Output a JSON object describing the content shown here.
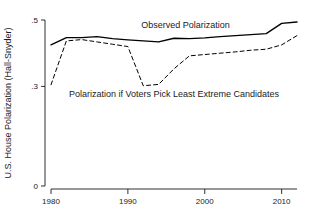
{
  "chart_data": {
    "type": "line",
    "title": "",
    "xlabel": "",
    "ylabel": "U.S. House Polarization (Hall-Snyder)",
    "xlim": [
      1980,
      2012
    ],
    "ylim": [
      0,
      0.5
    ],
    "xticks": [
      1980,
      1990,
      2000,
      2010
    ],
    "xtick_labels": [
      "1980",
      "1990",
      "2000",
      "2010"
    ],
    "yticks": [
      0,
      0.3,
      0.5
    ],
    "ytick_labels": [
      "0",
      ".3",
      ".5"
    ],
    "grid": false,
    "legend": "inline-annotations",
    "x": [
      1980,
      1982,
      1984,
      1986,
      1988,
      1990,
      1992,
      1994,
      1996,
      1998,
      2000,
      2002,
      2004,
      2006,
      2008,
      2010,
      2012
    ],
    "series": [
      {
        "name": "Observed Polarization",
        "style": "solid",
        "color": "#000000",
        "values": [
          0.425,
          0.447,
          0.447,
          0.45,
          0.444,
          0.44,
          0.437,
          0.434,
          0.445,
          0.444,
          0.446,
          0.45,
          0.453,
          0.456,
          0.459,
          0.49,
          0.494
        ]
      },
      {
        "name": "Polarization if Voters Pick Least Extreme Candidates",
        "style": "dashed",
        "color": "#000000",
        "values": [
          0.305,
          0.437,
          0.441,
          0.434,
          0.427,
          0.42,
          0.302,
          0.306,
          0.353,
          0.392,
          0.396,
          0.4,
          0.404,
          0.409,
          0.412,
          0.425,
          0.453
        ]
      }
    ],
    "annotations": [
      {
        "text": "Observed Polarization",
        "x": 1997.5,
        "y": 0.475
      },
      {
        "text": "Polarization if Voters Pick Least Extreme Candidates",
        "x": 1996.0,
        "y": 0.268
      }
    ]
  }
}
